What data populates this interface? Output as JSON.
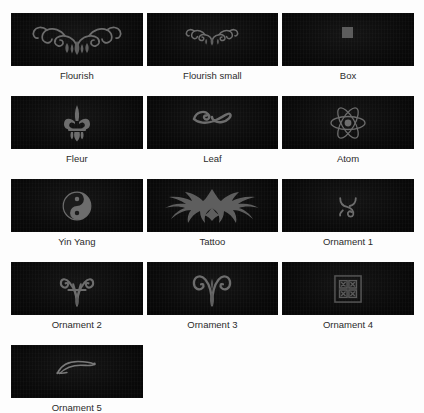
{
  "gallery": {
    "title": "Ornament Preview Gallery",
    "background_color": "#fdfdfd",
    "swatch_background": "#0b0b0b",
    "caption_color": "#2b2b2b",
    "ornament_color": "#6d6d6d",
    "columns": 3,
    "rows": [
      {
        "index": 1,
        "items": [
          {
            "label": "Flourish",
            "icon": "flourish-ornament-icon"
          },
          {
            "label": "Flourish small",
            "icon": "flourish-small-ornament-icon"
          },
          {
            "label": "Box",
            "icon": "box-ornament-icon"
          }
        ]
      },
      {
        "index": 2,
        "items": [
          {
            "label": "Fleur",
            "icon": "fleur-de-lis-ornament-icon"
          },
          {
            "label": "Leaf",
            "icon": "leaf-ornament-icon"
          },
          {
            "label": "Atom",
            "icon": "atom-ornament-icon"
          }
        ]
      },
      {
        "index": 3,
        "items": [
          {
            "label": "Yin Yang",
            "icon": "yin-yang-ornament-icon"
          },
          {
            "label": "Tattoo",
            "icon": "tribal-tattoo-ornament-icon"
          },
          {
            "label": "Ornament 1",
            "icon": "ornament-1-icon"
          }
        ]
      },
      {
        "index": 4,
        "items": [
          {
            "label": "Ornament 2",
            "icon": "ornament-2-icon"
          },
          {
            "label": "Ornament 3",
            "icon": "ornament-3-icon"
          },
          {
            "label": "Ornament 4",
            "icon": "ornament-4-icon"
          }
        ]
      },
      {
        "index": 5,
        "items": [
          {
            "label": "Ornament 5",
            "icon": "ornament-5-icon"
          }
        ]
      }
    ]
  }
}
